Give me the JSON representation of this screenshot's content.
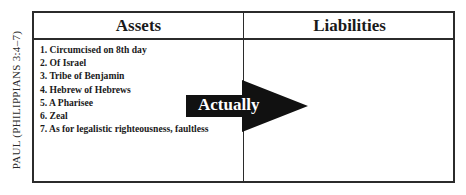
{
  "side_label": "PAUL (PHILIPPIANS 3:4–7)",
  "table": {
    "columns": [
      {
        "header": "Assets"
      },
      {
        "header": "Liabilities"
      }
    ],
    "assets": [
      "1. Circumcised on 8th day",
      "2. Of Israel",
      "3. Tribe of Benjamin",
      "4. Hebrew of Hebrews",
      "5. A Pharisee",
      "6. Zeal",
      "7. As for legalistic righteousness, faultless"
    ],
    "liabilities": []
  },
  "arrow": {
    "label": "Actually",
    "color": "#111111",
    "direction": "right"
  }
}
